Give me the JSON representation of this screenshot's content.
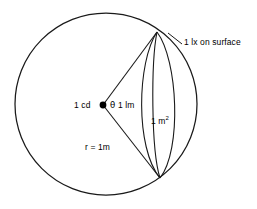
{
  "diagram": {
    "type": "geometric-diagram",
    "background_color": "#ffffff",
    "stroke_color": "#1a1a1a",
    "labels": {
      "illuminance": "1 lx on surface",
      "intensity": "1 cd",
      "angle_symbol": "θ",
      "flux": "1 lm",
      "area_value": "1 m",
      "area_exponent": "2",
      "radius": "r = 1m"
    },
    "geometry": {
      "circle": {
        "cx": 106,
        "cy": 104,
        "r": 91
      },
      "source_point": {
        "cx": 103,
        "cy": 105,
        "r": 3.4
      },
      "cap_top": {
        "x": 157,
        "y": 32
      },
      "cap_bottom": {
        "x": 160,
        "y": 178
      },
      "radius_lines": 2
    }
  }
}
